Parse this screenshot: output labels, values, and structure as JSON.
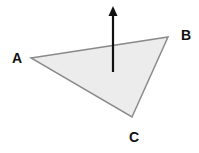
{
  "diagram": {
    "title": "",
    "colors": {
      "triangle_fill": "#ececec",
      "triangle_stroke": "#8a8a8a",
      "arrow": "#111111",
      "label": "#111111"
    },
    "vertices": [
      {
        "id": "A",
        "label": "A"
      },
      {
        "id": "B",
        "label": "B"
      },
      {
        "id": "C",
        "label": "C"
      }
    ],
    "shape": {
      "type": "triangle",
      "vertex_order": [
        "A",
        "B",
        "C"
      ]
    },
    "arrow": {
      "meaning": "surface-normal",
      "direction": "up"
    }
  }
}
